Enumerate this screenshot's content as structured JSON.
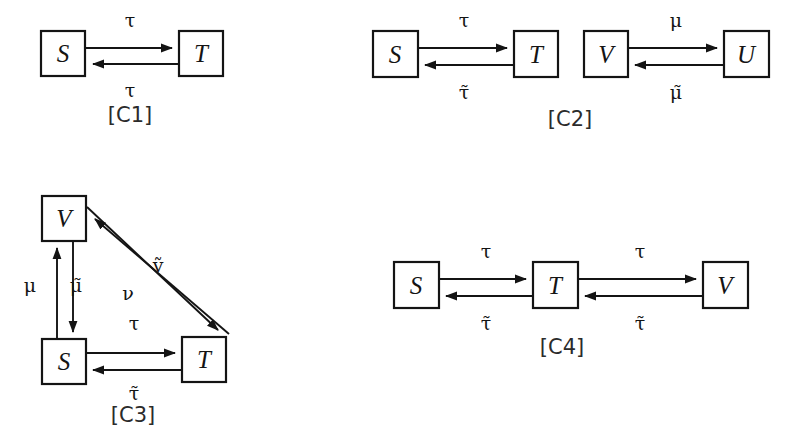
{
  "figure": {
    "background": "#ffffff",
    "ink": "#141414",
    "diagrams": [
      {
        "id": "C1",
        "caption": "[C1]",
        "caption_x": 130,
        "caption_y": 122,
        "nodes": [
          {
            "name": "S",
            "label": "S",
            "x": 41,
            "y": 31,
            "w": 44,
            "h": 45
          },
          {
            "name": "T",
            "label": "T",
            "x": 179,
            "y": 31,
            "w": 44,
            "h": 45
          }
        ],
        "edges": [
          {
            "name": "s-to-t",
            "from": "S",
            "to": "T",
            "label": "τ",
            "label_x": 130,
            "label_y": 27,
            "direction": "right",
            "y": 48
          },
          {
            "name": "t-to-s",
            "from": "T",
            "to": "S",
            "label": "τ",
            "label_x": 130,
            "label_y": 97,
            "direction": "left",
            "y": 64
          }
        ]
      },
      {
        "id": "C2",
        "caption": "[C2]",
        "caption_x": 570,
        "caption_y": 126,
        "nodes": [
          {
            "name": "S",
            "label": "S",
            "x": 373,
            "y": 31,
            "w": 45,
            "h": 46
          },
          {
            "name": "T",
            "label": "T",
            "x": 514,
            "y": 31,
            "w": 44,
            "h": 46
          },
          {
            "name": "V",
            "label": "V",
            "x": 584,
            "y": 31,
            "w": 44,
            "h": 46
          },
          {
            "name": "U",
            "label": "U",
            "x": 724,
            "y": 31,
            "w": 45,
            "h": 46
          }
        ],
        "edges": [
          {
            "name": "s-to-t",
            "from": "S",
            "to": "T",
            "label": "τ",
            "label_x": 464,
            "label_y": 27,
            "direction": "right",
            "y": 48
          },
          {
            "name": "t-to-s",
            "from": "T",
            "to": "S",
            "label": "τ̃",
            "label_x": 464,
            "label_y": 99,
            "direction": "left",
            "y": 65
          },
          {
            "name": "v-to-u",
            "from": "V",
            "to": "U",
            "label": "μ",
            "label_x": 676,
            "label_y": 27,
            "direction": "right",
            "y": 48
          },
          {
            "name": "u-to-v",
            "from": "U",
            "to": "V",
            "label": "μ̃",
            "label_x": 676,
            "label_y": 99,
            "direction": "left",
            "y": 65
          }
        ]
      },
      {
        "id": "C3",
        "caption": "[C3]",
        "caption_x": 133,
        "caption_y": 422,
        "nodes": [
          {
            "name": "V",
            "label": "V",
            "x": 42,
            "y": 196,
            "w": 44,
            "h": 45
          },
          {
            "name": "S",
            "label": "S",
            "x": 42,
            "y": 339,
            "w": 44,
            "h": 45
          },
          {
            "name": "T",
            "label": "T",
            "x": 182,
            "y": 337,
            "w": 44,
            "h": 45
          }
        ],
        "edges": [
          {
            "name": "s-to-v",
            "from": "S",
            "to": "V",
            "label": "μ",
            "label_x": 30,
            "label_y": 292,
            "direction": "up",
            "x": 57
          },
          {
            "name": "v-to-s",
            "from": "V",
            "to": "S",
            "label": "μ̃",
            "label_x": 74,
            "label_y": 292,
            "direction": "down",
            "x": 73
          },
          {
            "name": "s-to-t",
            "from": "S",
            "to": "T",
            "label": "τ",
            "label_x": 134,
            "label_y": 330,
            "direction": "right",
            "y": 353
          },
          {
            "name": "t-to-s",
            "from": "T",
            "to": "S",
            "label": "τ̃",
            "label_x": 134,
            "label_y": 400,
            "direction": "left",
            "y": 370
          },
          {
            "name": "v-to-t-diagonal",
            "from": "V",
            "to": "T",
            "label": "ν",
            "label_x": 128,
            "label_y": 300,
            "direction": "down-right"
          },
          {
            "name": "t-to-v-diagonal",
            "from": "T",
            "to": "V",
            "label": "ṽ",
            "label_x": 157,
            "label_y": 272,
            "direction": "up-left"
          }
        ]
      },
      {
        "id": "C4",
        "caption": "[C4]",
        "caption_x": 562,
        "caption_y": 354,
        "nodes": [
          {
            "name": "S",
            "label": "S",
            "x": 394,
            "y": 262,
            "w": 45,
            "h": 46
          },
          {
            "name": "T",
            "label": "T",
            "x": 533,
            "y": 262,
            "w": 45,
            "h": 46
          },
          {
            "name": "V",
            "label": "V",
            "x": 703,
            "y": 262,
            "w": 45,
            "h": 46
          }
        ],
        "edges": [
          {
            "name": "s-to-t",
            "from": "S",
            "to": "T",
            "label": "τ",
            "label_x": 486,
            "label_y": 258,
            "direction": "right",
            "y": 279
          },
          {
            "name": "t-to-s",
            "from": "T",
            "to": "S",
            "label": "τ̃",
            "label_x": 486,
            "label_y": 330,
            "direction": "left",
            "y": 296
          },
          {
            "name": "t-to-v",
            "from": "T",
            "to": "V",
            "label": "τ",
            "label_x": 640,
            "label_y": 258,
            "direction": "right",
            "y": 279
          },
          {
            "name": "v-to-t",
            "from": "V",
            "to": "T",
            "label": "τ̃",
            "label_x": 640,
            "label_y": 330,
            "direction": "left",
            "y": 296
          }
        ]
      }
    ]
  }
}
